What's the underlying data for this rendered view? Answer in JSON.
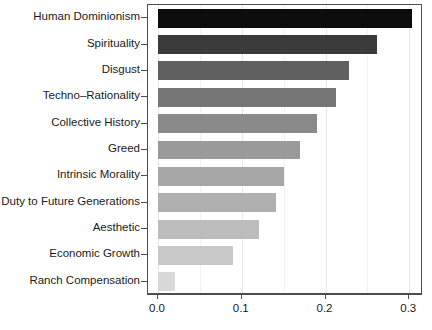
{
  "chart_data": {
    "type": "bar",
    "orientation": "horizontal",
    "title": "",
    "xlabel": "",
    "ylabel": "",
    "xlim": [
      0.0,
      0.33
    ],
    "xticks": [
      "0.0",
      "0.1",
      "0.2",
      "0.3"
    ],
    "xtick_values": [
      0.0,
      0.1,
      0.2,
      0.3
    ],
    "grid": true,
    "legend": "none",
    "categories": [
      "Human Dominionism",
      "Spirituality",
      "Disgust",
      "Techno–Rationality",
      "Collective History",
      "Greed",
      "Intrinsic Morality",
      "Duty to Future Generations",
      "Aesthetic",
      "Economic Growth",
      "Ranch Compensation"
    ],
    "values": [
      0.303,
      0.262,
      0.228,
      0.212,
      0.19,
      0.17,
      0.15,
      0.141,
      0.12,
      0.09,
      0.02
    ],
    "colors": [
      "#0d0d0d",
      "#3b3b3b",
      "#606060",
      "#767676",
      "#8a8a8a",
      "#9a9a9a",
      "#a6a6a6",
      "#b0b0b0",
      "#bcbcbc",
      "#c8c8c8",
      "#d8d8d8"
    ]
  },
  "axis": {
    "tick_color": "#4d4d4d",
    "grid_color": "#e6e6e6",
    "frame_color": "#4d4d4d"
  }
}
